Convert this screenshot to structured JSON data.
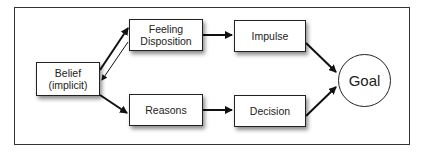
{
  "diagram": {
    "nodes": {
      "belief": {
        "label": "Belief\n(implicit)"
      },
      "feeling": {
        "label": "Feeling\nDisposition"
      },
      "reasons": {
        "label": "Reasons"
      },
      "impulse": {
        "label": "Impulse"
      },
      "decision": {
        "label": "Decision"
      },
      "goal": {
        "label": "Goal"
      }
    },
    "edges": [
      {
        "from": "Belief (implicit)",
        "to": "Feeling Disposition",
        "style": "thick"
      },
      {
        "from": "Feeling Disposition",
        "to": "Belief (implicit)",
        "style": "thin"
      },
      {
        "from": "Belief (implicit)",
        "to": "Reasons",
        "style": "thick"
      },
      {
        "from": "Feeling Disposition",
        "to": "Impulse",
        "style": "thick"
      },
      {
        "from": "Reasons",
        "to": "Decision",
        "style": "thick"
      },
      {
        "from": "Impulse",
        "to": "Goal",
        "style": "thick"
      },
      {
        "from": "Decision",
        "to": "Goal",
        "style": "thick"
      }
    ],
    "colors": {
      "stroke": "#222222",
      "background": "#ffffff"
    }
  }
}
